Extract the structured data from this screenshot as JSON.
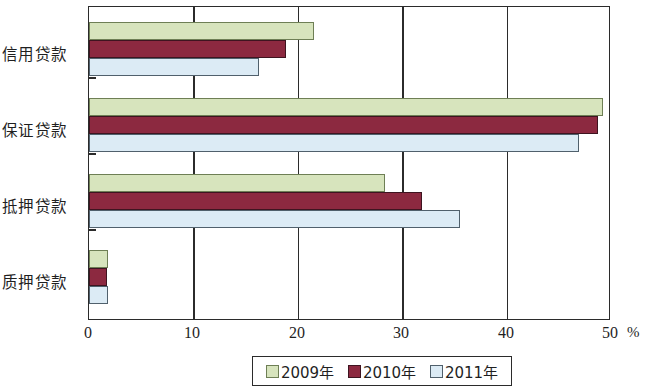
{
  "chart_data": {
    "type": "bar",
    "orientation": "horizontal",
    "title": "",
    "xlabel": "%",
    "ylabel": "",
    "xlim": [
      0,
      50
    ],
    "xticks": [
      0,
      10,
      20,
      30,
      40,
      50
    ],
    "xtick_labels": [
      "0",
      "10",
      "20",
      "30",
      "40",
      "50"
    ],
    "grid": true,
    "legend_position": "bottom",
    "categories": [
      "信用贷款",
      "保证贷款",
      "抵押贷款",
      "质押贷款"
    ],
    "series": [
      {
        "name": "2009年",
        "color": "#d7e4bd",
        "values": [
          21.6,
          49.3,
          28.4,
          1.8
        ]
      },
      {
        "name": "2010年",
        "color": "#8c2940",
        "values": [
          18.9,
          48.9,
          32.0,
          1.7
        ]
      },
      {
        "name": "2011年",
        "color": "#dcebf5",
        "values": [
          16.3,
          47.0,
          35.6,
          1.8
        ]
      }
    ]
  },
  "axis": {
    "unit": "%",
    "ticks": [
      "0",
      "10",
      "20",
      "30",
      "40",
      "50"
    ]
  },
  "legend": {
    "items": [
      {
        "label": "2009年",
        "key": "s2009"
      },
      {
        "label": "2010年",
        "key": "s2010"
      },
      {
        "label": "2011年",
        "key": "s2011"
      }
    ]
  }
}
